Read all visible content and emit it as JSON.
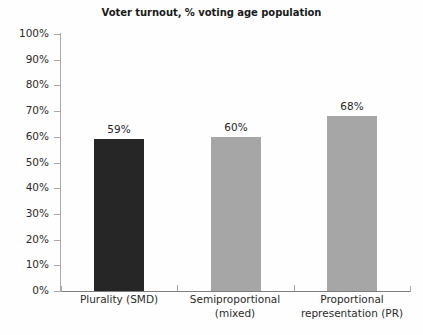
{
  "chart_data": {
    "type": "bar",
    "title": "Voter turnout, % voting age population",
    "xlabel": "",
    "ylabel": "",
    "categories": [
      "Plurality (SMD)",
      "Semiproportional (mixed)",
      "Proportional representation (PR)"
    ],
    "category_lines": [
      [
        "Plurality (SMD)"
      ],
      [
        "Semiproportional",
        "(mixed)"
      ],
      [
        "Proportional",
        "representation (PR)"
      ]
    ],
    "values": [
      59,
      60,
      68
    ],
    "data_labels": [
      "59%",
      "60%",
      "68%"
    ],
    "bar_colors": [
      "#262626",
      "#a6a6a6",
      "#a6a6a6"
    ],
    "ylim": [
      0,
      100
    ],
    "ytick_values": [
      0,
      10,
      20,
      30,
      40,
      50,
      60,
      70,
      80,
      90,
      100
    ],
    "ytick_labels": [
      "0%",
      "10%",
      "20%",
      "30%",
      "40%",
      "50%",
      "60%",
      "70%",
      "80%",
      "90%",
      "100%"
    ],
    "grid": false,
    "legend": false,
    "legend_position": "none",
    "units": "percent",
    "axis_color": "#a8a8a8",
    "background_color": "#fefefe"
  }
}
